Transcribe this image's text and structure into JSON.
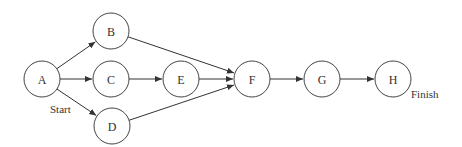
{
  "diagram": {
    "type": "network-precedence-diagram",
    "radius": 18,
    "nodes": [
      {
        "id": "A",
        "label": "A",
        "x": 42,
        "y": 79
      },
      {
        "id": "B",
        "label": "B",
        "x": 111,
        "y": 31
      },
      {
        "id": "C",
        "label": "C",
        "x": 111,
        "y": 79
      },
      {
        "id": "D",
        "label": "D",
        "x": 112,
        "y": 126
      },
      {
        "id": "E",
        "label": "E",
        "x": 181,
        "y": 79
      },
      {
        "id": "F",
        "label": "F",
        "x": 252,
        "y": 79
      },
      {
        "id": "G",
        "label": "G",
        "x": 322,
        "y": 79
      },
      {
        "id": "H",
        "label": "H",
        "x": 393,
        "y": 79
      }
    ],
    "edges": [
      {
        "from": "A",
        "to": "B"
      },
      {
        "from": "A",
        "to": "C"
      },
      {
        "from": "A",
        "to": "D"
      },
      {
        "from": "B",
        "to": "F"
      },
      {
        "from": "C",
        "to": "E"
      },
      {
        "from": "E",
        "to": "F"
      },
      {
        "from": "D",
        "to": "F"
      },
      {
        "from": "F",
        "to": "G"
      },
      {
        "from": "G",
        "to": "H"
      }
    ],
    "annotations": {
      "start": {
        "text": "Start",
        "x": 50,
        "y": 113
      },
      "finish": {
        "text": "Finish",
        "x": 411,
        "y": 98
      }
    },
    "colors": {
      "stroke": "#444444",
      "text": "#333333",
      "background": "#ffffff"
    }
  }
}
